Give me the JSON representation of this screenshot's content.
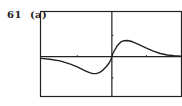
{
  "label": {
    "problem_number": "61",
    "part": "(a)"
  },
  "chart_data": {
    "type": "line",
    "title": "",
    "xlabel": "",
    "ylabel": "",
    "xlim": [
      -2.05,
      2.0
    ],
    "ylim": [
      -1.85,
      2.1
    ],
    "xticks": [
      -1,
      1
    ],
    "yticks": [
      -1,
      1
    ],
    "grid": false,
    "legend": "none",
    "series": [
      {
        "name": "f(x)",
        "x": [
          -2.05,
          -1.8,
          -1.5,
          -1.2,
          -1.0,
          -0.8,
          -0.65,
          -0.55,
          -0.45,
          -0.35,
          -0.25,
          -0.15,
          -0.08,
          -0.03,
          0.0,
          0.03,
          0.08,
          0.15,
          0.25,
          0.35,
          0.46,
          0.6,
          0.8,
          1.0,
          1.2,
          1.4,
          1.6,
          1.8,
          2.0
        ],
        "y": [
          -0.08,
          -0.12,
          -0.2,
          -0.35,
          -0.48,
          -0.64,
          -0.75,
          -0.8,
          -0.8,
          -0.74,
          -0.62,
          -0.45,
          -0.3,
          -0.15,
          0.0,
          0.15,
          0.3,
          0.5,
          0.68,
          0.75,
          0.76,
          0.7,
          0.55,
          0.4,
          0.26,
          0.15,
          0.08,
          0.04,
          0.02
        ]
      }
    ]
  }
}
